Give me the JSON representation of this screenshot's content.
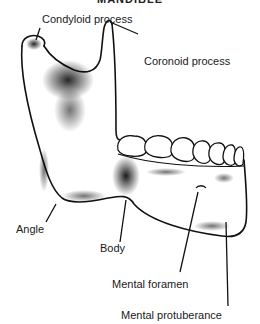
{
  "diagram": {
    "title": "MANDIBLE",
    "labels": {
      "condyloid": "Condyloid process",
      "coronoid": "Coronoid process",
      "angle": "Angle",
      "body": "Body",
      "mental_foramen": "Mental foramen",
      "mental_protuberance": "Mental protuberance"
    }
  }
}
